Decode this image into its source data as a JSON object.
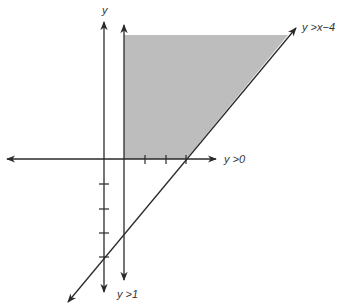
{
  "diagram": {
    "type": "linear-inequality-graph",
    "colors": {
      "shaded_region": "#bdbdbd",
      "lines": "#2a2a2a",
      "labels": "#333333"
    },
    "axes": {
      "vertical_axis_label": "y",
      "x_axis_ticks": [
        1,
        2,
        3
      ],
      "y_axis_ticks": [
        -1,
        -2,
        -3,
        -4
      ]
    },
    "boundaries": [
      {
        "id": "diagonal",
        "label": "y >x−4",
        "equation": "y = x - 4",
        "intercepts": {
          "x": 4,
          "y": -4
        }
      },
      {
        "id": "horizontal",
        "label": "y >0",
        "equation": "y = 0"
      },
      {
        "id": "vertical",
        "label": "y >1",
        "equation": "x = 1"
      }
    ],
    "shaded_region": {
      "description": "region right of x=1, above y=0, left/above y=x-4",
      "vertices": [
        [
          1,
          0
        ],
        [
          4,
          0
        ]
      ]
    }
  }
}
